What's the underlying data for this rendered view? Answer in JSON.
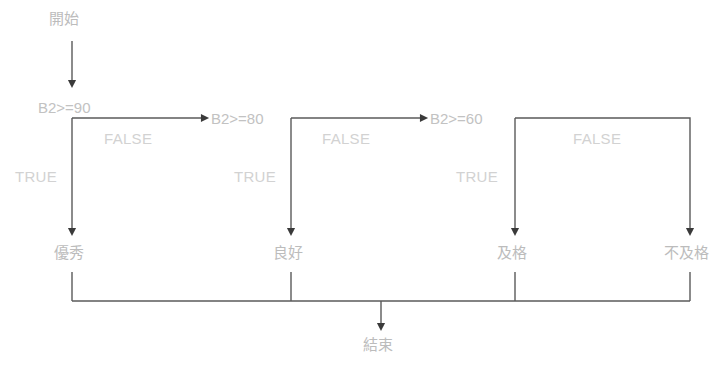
{
  "diagram": {
    "type": "flowchart",
    "title_text": "",
    "colors": {
      "line": "#5a5a5a",
      "node_text": "#bcbcbc",
      "condition_text": "#c2c2c2",
      "branch_text": "#d2d2d2",
      "background": "#ffffff"
    },
    "start_node": {
      "label": "開始"
    },
    "end_node": {
      "label": "結束"
    },
    "decisions": [
      {
        "id": "d1",
        "label": "B2>=90",
        "true_label": "TRUE",
        "false_label": "FALSE",
        "true_target": "優秀",
        "false_target": "B2>=80"
      },
      {
        "id": "d2",
        "label": "B2>=80",
        "true_label": "TRUE",
        "false_label": "FALSE",
        "true_target": "良好",
        "false_target": "B2>=60"
      },
      {
        "id": "d3",
        "label": "B2>=60",
        "true_label": "TRUE",
        "false_label": "FALSE",
        "true_target": "及格",
        "false_target": "不及格"
      }
    ],
    "outcomes": [
      {
        "id": "o1",
        "label": "優秀"
      },
      {
        "id": "o2",
        "label": "良好"
      },
      {
        "id": "o3",
        "label": "及格"
      },
      {
        "id": "o4",
        "label": "不及格"
      }
    ]
  }
}
